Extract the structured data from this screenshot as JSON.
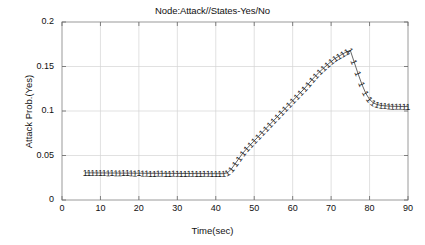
{
  "chart_data": {
    "type": "line",
    "title": "Node:Attack//States-Yes/No",
    "xlabel": "Time(sec)",
    "ylabel": "Attack Prob.(Yes)",
    "xlim": [
      0,
      90
    ],
    "ylim": [
      0,
      0.2
    ],
    "xticks": [
      "0",
      "10",
      "20",
      "30",
      "40",
      "50",
      "60",
      "70",
      "80",
      "90"
    ],
    "xtick_values": [
      0,
      10,
      20,
      30,
      40,
      50,
      60,
      70,
      80,
      90
    ],
    "yticks": [
      "0",
      "0.05",
      "0.1",
      "0.15",
      "0.2"
    ],
    "ytick_values": [
      0,
      0.05,
      0.1,
      0.15,
      0.2
    ],
    "grid": true,
    "legend": "none",
    "marker": "1",
    "line_color": "#555555",
    "marker_color": "#1a1a1a",
    "series": [
      {
        "name": "Attack Prob.(Yes)",
        "x": [
          6,
          7,
          8,
          9,
          10,
          11,
          12,
          13,
          14,
          15,
          16,
          17,
          18,
          19,
          20,
          21,
          22,
          23,
          24,
          25,
          26,
          27,
          28,
          29,
          30,
          31,
          32,
          33,
          34,
          35,
          36,
          37,
          38,
          39,
          40,
          41,
          42,
          43,
          44,
          45,
          46,
          47,
          48,
          49,
          50,
          51,
          52,
          53,
          54,
          55,
          56,
          57,
          58,
          59,
          60,
          61,
          62,
          63,
          64,
          65,
          66,
          67,
          68,
          69,
          70,
          71,
          72,
          73,
          74,
          75,
          76,
          77,
          78,
          79,
          80,
          81,
          82,
          83,
          84,
          85,
          86,
          87,
          88,
          89,
          90
        ],
        "y": [
          0.0305,
          0.0305,
          0.0305,
          0.0304,
          0.0304,
          0.0304,
          0.0303,
          0.0303,
          0.0303,
          0.0302,
          0.0302,
          0.0302,
          0.0302,
          0.0301,
          0.0301,
          0.0301,
          0.03,
          0.03,
          0.03,
          0.03,
          0.0299,
          0.0299,
          0.0299,
          0.0299,
          0.0298,
          0.0298,
          0.0298,
          0.0298,
          0.0297,
          0.0297,
          0.0297,
          0.0297,
          0.0296,
          0.0296,
          0.0296,
          0.0296,
          0.0296,
          0.0305,
          0.0345,
          0.0405,
          0.0465,
          0.0525,
          0.0575,
          0.062,
          0.0665,
          0.071,
          0.0755,
          0.08,
          0.0845,
          0.089,
          0.0935,
          0.098,
          0.1025,
          0.107,
          0.1115,
          0.116,
          0.1205,
          0.125,
          0.13,
          0.135,
          0.1395,
          0.144,
          0.148,
          0.152,
          0.1555,
          0.159,
          0.1615,
          0.164,
          0.1665,
          0.168,
          0.155,
          0.142,
          0.13,
          0.12,
          0.113,
          0.109,
          0.1072,
          0.1062,
          0.1058,
          0.1055,
          0.1053,
          0.1052,
          0.1051,
          0.105,
          0.105
        ]
      }
    ]
  },
  "axes": {
    "title": "Node:Attack//States-Yes/No",
    "xlabel": "Time(sec)",
    "ylabel": "Attack Prob.(Yes)"
  }
}
